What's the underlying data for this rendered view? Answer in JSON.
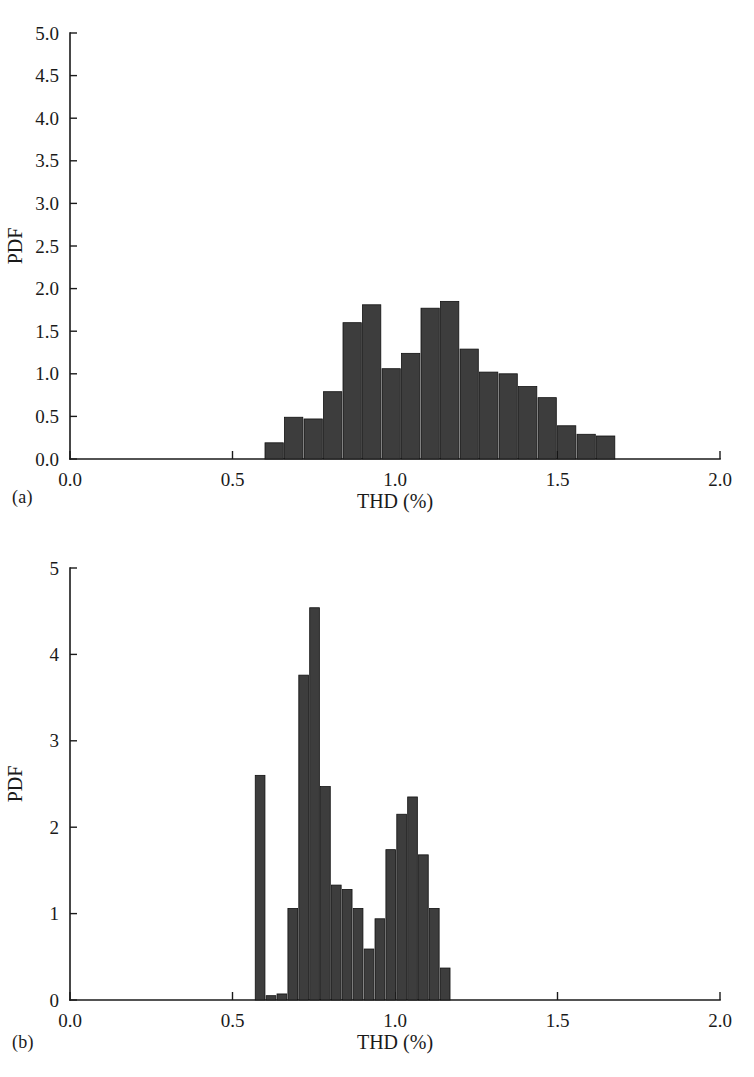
{
  "figure": {
    "panel_a_label": "(a)",
    "panel_b_label": "(b)"
  },
  "chart_data": [
    {
      "id": "panel-a",
      "type": "bar",
      "title": "",
      "subtitle": "",
      "xlabel": "THD (%)",
      "ylabel": "PDF",
      "panel_label": "(a)",
      "xlim": [
        0.0,
        2.0
      ],
      "ylim": [
        0.0,
        5.0
      ],
      "xticks": [
        0.0,
        0.5,
        1.0,
        1.5,
        2.0
      ],
      "xtick_labels": [
        "0.0",
        "0.5",
        "1.0",
        "1.5",
        "2.0"
      ],
      "yticks": [
        0.0,
        0.5,
        1.0,
        1.5,
        2.0,
        2.5,
        3.0,
        3.5,
        4.0,
        4.5,
        5.0
      ],
      "ytick_labels": [
        "0.0",
        "0.5",
        "1.0",
        "1.5",
        "2.0",
        "2.5",
        "3.0",
        "3.5",
        "4.0",
        "4.5",
        "5.0"
      ],
      "grid": false,
      "legend": null,
      "bar_color": "#3d3d3d",
      "bin_width": 0.06,
      "bin_starts": [
        0.6,
        0.66,
        0.72,
        0.78,
        0.84,
        0.9,
        0.96,
        1.02,
        1.08,
        1.14,
        1.2,
        1.26,
        1.32,
        1.38,
        1.44,
        1.5,
        1.56,
        1.62
      ],
      "bin_centers": [
        0.63,
        0.69,
        0.75,
        0.81,
        0.87,
        0.93,
        0.99,
        1.05,
        1.11,
        1.17,
        1.23,
        1.29,
        1.35,
        1.41,
        1.47,
        1.53,
        1.59,
        1.65
      ],
      "values": [
        0.19,
        0.49,
        0.47,
        0.79,
        1.6,
        1.81,
        1.06,
        1.24,
        1.77,
        1.85,
        1.29,
        1.02,
        1.0,
        0.85,
        0.72,
        0.39,
        0.29,
        0.27
      ]
    },
    {
      "id": "panel-b",
      "type": "bar",
      "title": "",
      "subtitle": "",
      "xlabel": "THD (%)",
      "ylabel": "PDF",
      "panel_label": "(b)",
      "xlim": [
        0.0,
        2.0
      ],
      "ylim": [
        0,
        5
      ],
      "xticks": [
        0.0,
        0.5,
        1.0,
        1.5,
        2.0
      ],
      "xtick_labels": [
        "0.0",
        "0.5",
        "1.0",
        "1.5",
        "2.0"
      ],
      "yticks": [
        0,
        1,
        2,
        3,
        4,
        5
      ],
      "ytick_labels": [
        "0",
        "1",
        "2",
        "3",
        "4",
        "5"
      ],
      "grid": false,
      "legend": null,
      "bar_color": "#3d3d3d",
      "bin_width": 0.0335,
      "bin_starts": [
        0.57,
        0.6035,
        0.637,
        0.6705,
        0.704,
        0.7375,
        0.771,
        0.8045,
        0.838,
        0.8715,
        0.905,
        0.9385,
        0.972,
        1.0055,
        1.039,
        1.0725,
        1.106,
        1.1395
      ],
      "bin_centers": [
        0.587,
        0.62,
        0.654,
        0.687,
        0.721,
        0.754,
        0.788,
        0.821,
        0.855,
        0.888,
        0.922,
        0.955,
        0.989,
        1.022,
        1.056,
        1.089,
        1.123,
        1.156
      ],
      "values": [
        2.6,
        0.05,
        0.07,
        1.06,
        3.76,
        4.54,
        2.47,
        1.33,
        1.28,
        1.06,
        0.59,
        0.94,
        1.74,
        2.15,
        2.35,
        1.68,
        1.06,
        0.37
      ]
    }
  ]
}
